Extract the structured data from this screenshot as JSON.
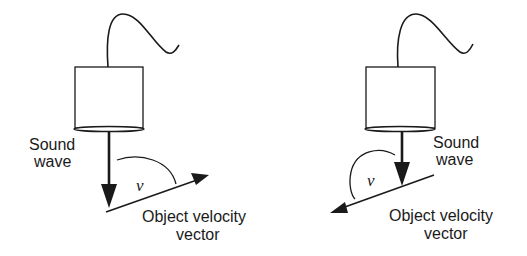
{
  "figures": [
    {
      "id": "left",
      "sound_wave_label": [
        "Sound",
        "wave"
      ],
      "angle_symbol": "v",
      "velocity_label": [
        "Object velocity",
        "vector"
      ],
      "angle_type": "acute"
    },
    {
      "id": "right",
      "sound_wave_label": [
        "Sound",
        "wave"
      ],
      "angle_symbol": "v",
      "velocity_label": [
        "Object velocity",
        "vector"
      ],
      "angle_type": "obtuse"
    }
  ],
  "colors": {
    "stroke": "#1a1a1a",
    "background": "#ffffff"
  }
}
